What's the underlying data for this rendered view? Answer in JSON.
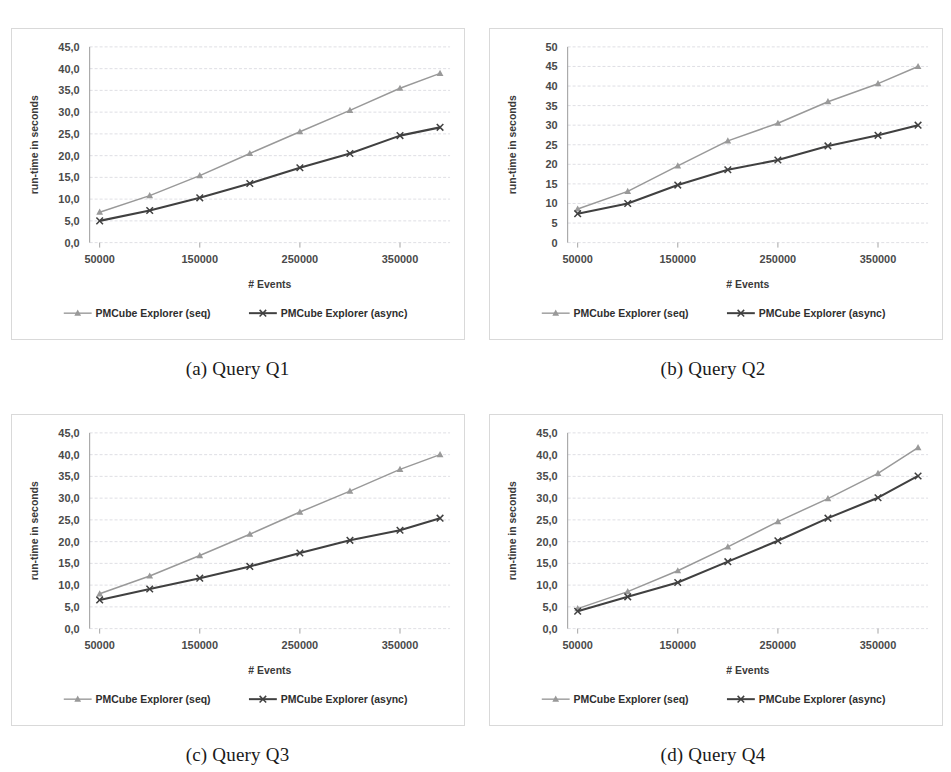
{
  "figure": {
    "series_colors": {
      "seq": "#999999",
      "async": "#404040"
    },
    "legend": {
      "seq_label": "PMCube Explorer (seq)",
      "async_label": "PMCube Explorer (async)",
      "seq_marker": "triangle-marker-icon",
      "async_marker": "cross-marker-icon"
    },
    "subfigures": [
      {
        "caption": "(a) Query Q1",
        "panel_id": "panel-a"
      },
      {
        "caption": "(b) Query Q2",
        "panel_id": "panel-b"
      },
      {
        "caption": "(c) Query Q3",
        "panel_id": "panel-c"
      },
      {
        "caption": "(d) Query Q4",
        "panel_id": "panel-d"
      }
    ]
  },
  "chart_data": [
    {
      "id": "panel-a",
      "type": "line",
      "title": "(a) Query Q1",
      "xlabel": "# Events",
      "ylabel": "run-time in seconds",
      "x": [
        50000,
        100000,
        150000,
        200000,
        250000,
        300000,
        350000,
        390000
      ],
      "xticks": [
        50000,
        150000,
        250000,
        350000
      ],
      "xticklabels": [
        "50000",
        "150000",
        "250000",
        "350000"
      ],
      "xlim": [
        40000,
        400000
      ],
      "ylim": [
        0,
        45
      ],
      "yticks": [
        0,
        5,
        10,
        15,
        20,
        25,
        30,
        35,
        40,
        45
      ],
      "yticklabels": [
        "0,0",
        "5,0",
        "10,0",
        "15,0",
        "20,0",
        "25,0",
        "30,0",
        "35,0",
        "40,0",
        "45,0"
      ],
      "grid": true,
      "legend_position": "below",
      "series": [
        {
          "name": "PMCube Explorer (seq)",
          "marker": "triangle",
          "color": "#999999",
          "values": [
            7.0,
            10.8,
            15.4,
            20.5,
            25.5,
            30.4,
            35.5,
            38.9
          ]
        },
        {
          "name": "PMCube Explorer (async)",
          "marker": "cross",
          "color": "#404040",
          "values": [
            5.0,
            7.4,
            10.3,
            13.6,
            17.2,
            20.5,
            24.6,
            26.5
          ]
        }
      ]
    },
    {
      "id": "panel-b",
      "type": "line",
      "title": "(b) Query Q2",
      "xlabel": "# Events",
      "ylabel": "run-time in seconds",
      "x": [
        50000,
        100000,
        150000,
        200000,
        250000,
        300000,
        350000,
        390000
      ],
      "xticks": [
        50000,
        150000,
        250000,
        350000
      ],
      "xticklabels": [
        "50000",
        "150000",
        "250000",
        "350000"
      ],
      "xlim": [
        40000,
        400000
      ],
      "ylim": [
        0,
        50
      ],
      "yticks": [
        0,
        5,
        10,
        15,
        20,
        25,
        30,
        35,
        40,
        45,
        50
      ],
      "yticklabels": [
        "0",
        "5",
        "10",
        "15",
        "20",
        "25",
        "30",
        "35",
        "40",
        "45",
        "50"
      ],
      "grid": true,
      "legend_position": "below",
      "series": [
        {
          "name": "PMCube Explorer (seq)",
          "marker": "triangle",
          "color": "#999999",
          "values": [
            8.6,
            13.1,
            19.6,
            26.0,
            30.5,
            36.0,
            40.6,
            45.0
          ]
        },
        {
          "name": "PMCube Explorer (async)",
          "marker": "cross",
          "color": "#404040",
          "values": [
            7.4,
            10.0,
            14.7,
            18.6,
            21.1,
            24.7,
            27.4,
            30.0
          ]
        }
      ]
    },
    {
      "id": "panel-c",
      "type": "line",
      "title": "(c) Query Q3",
      "xlabel": "# Events",
      "ylabel": "run-time in seconds",
      "x": [
        50000,
        100000,
        150000,
        200000,
        250000,
        300000,
        350000,
        390000
      ],
      "xticks": [
        50000,
        150000,
        250000,
        350000
      ],
      "xticklabels": [
        "50000",
        "150000",
        "250000",
        "350000"
      ],
      "xlim": [
        40000,
        400000
      ],
      "ylim": [
        0,
        45
      ],
      "yticks": [
        0,
        5,
        10,
        15,
        20,
        25,
        30,
        35,
        40,
        45
      ],
      "yticklabels": [
        "0,0",
        "5,0",
        "10,0",
        "15,0",
        "20,0",
        "25,0",
        "30,0",
        "35,0",
        "40,0",
        "45,0"
      ],
      "grid": true,
      "legend_position": "below",
      "series": [
        {
          "name": "PMCube Explorer (seq)",
          "marker": "triangle",
          "color": "#999999",
          "values": [
            8.0,
            12.1,
            16.8,
            21.7,
            26.8,
            31.6,
            36.6,
            40.0
          ]
        },
        {
          "name": "PMCube Explorer (async)",
          "marker": "cross",
          "color": "#404040",
          "values": [
            6.6,
            9.1,
            11.6,
            14.3,
            17.4,
            20.3,
            22.6,
            25.4
          ]
        }
      ]
    },
    {
      "id": "panel-d",
      "type": "line",
      "title": "(d) Query Q4",
      "xlabel": "# Events",
      "ylabel": "run-time in seconds",
      "x": [
        50000,
        100000,
        150000,
        200000,
        250000,
        300000,
        350000,
        390000
      ],
      "xticks": [
        50000,
        150000,
        250000,
        350000
      ],
      "xticklabels": [
        "50000",
        "150000",
        "250000",
        "350000"
      ],
      "xlim": [
        40000,
        400000
      ],
      "ylim": [
        0,
        45
      ],
      "yticks": [
        0,
        5,
        10,
        15,
        20,
        25,
        30,
        35,
        40,
        45
      ],
      "yticklabels": [
        "0,0",
        "5,0",
        "10,0",
        "15,0",
        "20,0",
        "25,0",
        "30,0",
        "35,0",
        "40,0",
        "45,0"
      ],
      "grid": true,
      "legend_position": "below",
      "series": [
        {
          "name": "PMCube Explorer (seq)",
          "marker": "triangle",
          "color": "#999999",
          "values": [
            4.6,
            8.5,
            13.3,
            18.8,
            24.6,
            29.9,
            35.7,
            41.6
          ]
        },
        {
          "name": "PMCube Explorer (async)",
          "marker": "cross",
          "color": "#404040",
          "values": [
            4.0,
            7.3,
            10.6,
            15.4,
            20.2,
            25.4,
            30.1,
            35.1
          ]
        }
      ]
    }
  ]
}
